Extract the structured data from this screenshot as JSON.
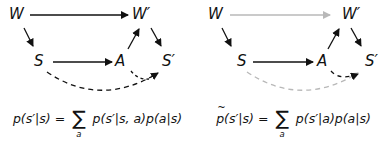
{
  "colors": {
    "arrow": "#111111",
    "faded_arrow": "#b8b8b8",
    "text": "#111111"
  },
  "diagrams": [
    {
      "nodes": {
        "W": "W",
        "Wp": "W′",
        "S": "S",
        "A": "A",
        "Sp": "S′"
      },
      "edges": [
        {
          "from": "W",
          "to": "W′",
          "style": "solid",
          "color": "black"
        },
        {
          "from": "W",
          "to": "S",
          "style": "solid",
          "color": "black"
        },
        {
          "from": "S",
          "to": "A",
          "style": "solid",
          "color": "black"
        },
        {
          "from": "A",
          "to": "W′",
          "style": "solid",
          "color": "black"
        },
        {
          "from": "W′",
          "to": "S′",
          "style": "solid",
          "color": "black"
        },
        {
          "from": "S",
          "to": "S′",
          "style": "dashed",
          "color": "black"
        },
        {
          "from": "A",
          "to": "S′",
          "style": "dashed",
          "color": "black"
        }
      ],
      "formula": {
        "lhs": "p(s′|s)",
        "equals": "=",
        "sum": "∑",
        "sum_index": "a",
        "rhs": "p(s′|s, a)p(a|s)"
      }
    },
    {
      "nodes": {
        "W": "W",
        "Wp": "W′",
        "S": "S",
        "A": "A",
        "Sp": "S′"
      },
      "edges": [
        {
          "from": "W",
          "to": "W′",
          "style": "solid",
          "color": "gray"
        },
        {
          "from": "W",
          "to": "S",
          "style": "solid",
          "color": "black"
        },
        {
          "from": "S",
          "to": "A",
          "style": "solid",
          "color": "black"
        },
        {
          "from": "A",
          "to": "W′",
          "style": "solid",
          "color": "black"
        },
        {
          "from": "W′",
          "to": "S′",
          "style": "solid",
          "color": "black"
        },
        {
          "from": "S",
          "to": "S′",
          "style": "dashed",
          "color": "gray"
        },
        {
          "from": "A",
          "to": "S′",
          "style": "dashed",
          "color": "black"
        }
      ],
      "formula": {
        "lhs_tilde": "p",
        "lhs": "(s′|s)",
        "equals": "=",
        "sum": "∑",
        "sum_index": "a",
        "rhs": "p(s′|a)p(a|s)"
      }
    }
  ]
}
